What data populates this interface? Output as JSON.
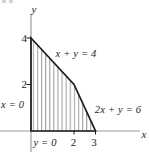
{
  "figure": {
    "background_color": "#ffffff",
    "axis_color": "#9b9b9b",
    "boundary_color": "#1c1c1c",
    "hatch_color": "#8f8f8f",
    "text_color": "#242424",
    "axis_labels": {
      "x": "x",
      "y": "y"
    },
    "equations": {
      "diagonal_upper": "x + y = 4",
      "diagonal_lower": "2x + y = 6",
      "left": "x = 0",
      "bottom": "y = 0"
    },
    "y_ticks": [
      "4",
      "2"
    ],
    "x_ticks": [
      "2",
      "3"
    ],
    "region": {
      "vertices": [
        [
          0,
          0
        ],
        [
          0,
          4
        ],
        [
          2,
          2
        ],
        [
          3,
          0
        ]
      ],
      "shading": "vertical-hatch"
    }
  }
}
